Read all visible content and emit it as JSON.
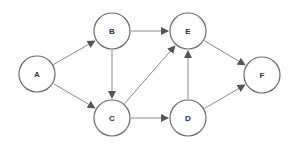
{
  "diagram": {
    "type": "directed-graph",
    "colors": {
      "node_stroke": "#6b6b6b",
      "node_fill": "#ffffff",
      "edge": "#8a8a8a",
      "arrowhead": "#555555",
      "label": "#333333"
    },
    "node_radius": 18,
    "nodes": [
      {
        "id": "A",
        "label": "A",
        "x": 37,
        "y": 74
      },
      {
        "id": "B",
        "label": "B",
        "x": 112,
        "y": 31
      },
      {
        "id": "C",
        "label": "C",
        "x": 112,
        "y": 118
      },
      {
        "id": "E",
        "label": "E",
        "x": 188,
        "y": 31
      },
      {
        "id": "D",
        "label": "D",
        "x": 188,
        "y": 118
      },
      {
        "id": "F",
        "label": "F",
        "x": 262,
        "y": 75
      }
    ],
    "edges": [
      {
        "from": "A",
        "to": "B"
      },
      {
        "from": "A",
        "to": "C"
      },
      {
        "from": "B",
        "to": "E"
      },
      {
        "from": "B",
        "to": "C"
      },
      {
        "from": "C",
        "to": "E"
      },
      {
        "from": "C",
        "to": "D"
      },
      {
        "from": "D",
        "to": "E"
      },
      {
        "from": "E",
        "to": "F"
      },
      {
        "from": "D",
        "to": "F"
      }
    ]
  }
}
